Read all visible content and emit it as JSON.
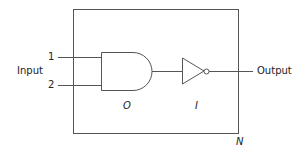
{
  "diagram": {
    "input_label": "Input",
    "output_label": "Output",
    "input_numbers": [
      "1",
      "2"
    ],
    "and_gate_label": "O",
    "inverter_label": "I",
    "box_label": "N",
    "stroke_color": "#555555"
  }
}
